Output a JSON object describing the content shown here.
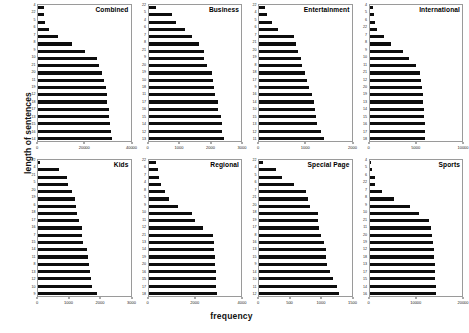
{
  "chart_data": {
    "type": "bar",
    "title": "",
    "xlabel": "frequency",
    "ylabel": "length of sentences",
    "orientation": "horizontal",
    "grid": false,
    "legend": null,
    "layout": "2 rows x 4 columns of small-multiple horizontal bar charts",
    "note": "Each panel shows frequency of sentences by sentence length, sorted ascending by frequency",
    "panels": [
      {
        "title": "Combined",
        "xlim": [
          0,
          40000
        ],
        "xticks": [
          0,
          20000,
          40000
        ],
        "xticklabels": [
          "0",
          "20000",
          "40000"
        ],
        "categories": [
          "4",
          "22",
          "5",
          "6",
          "7",
          "8",
          "9",
          "10",
          "21",
          "20",
          "11",
          "19",
          "12",
          "18",
          "17",
          "13",
          "15",
          "16",
          "14"
        ],
        "values": [
          2600,
          2700,
          3100,
          4600,
          8600,
          14500,
          20500,
          25500,
          26400,
          27600,
          28500,
          29200,
          29800,
          30000,
          30600,
          30900,
          31000,
          31400,
          31800
        ]
      },
      {
        "title": "Business",
        "xlim": [
          0,
          3000
        ],
        "xticks": [
          0,
          1000,
          2000,
          3000
        ],
        "xticklabels": [
          "0",
          "1000",
          "2000",
          "3000"
        ],
        "categories": [
          "22",
          "5",
          "4",
          "6",
          "7",
          "8",
          "21",
          "9",
          "20",
          "19",
          "10",
          "18",
          "11",
          "17",
          "16",
          "15",
          "14",
          "12",
          "13"
        ],
        "values": [
          230,
          760,
          900,
          1180,
          1400,
          1630,
          1790,
          1800,
          1900,
          2060,
          2100,
          2130,
          2160,
          2240,
          2260,
          2360,
          2370,
          2380,
          2440
        ]
      },
      {
        "title": "Entertainment",
        "xlim": [
          0,
          2000
        ],
        "xticks": [
          0,
          1000,
          2000
        ],
        "xticklabels": [
          "0",
          "1000",
          "2000"
        ],
        "categories": [
          "22",
          "4",
          "5",
          "6",
          "7",
          "21",
          "20",
          "19",
          "8",
          "18",
          "17",
          "9",
          "16",
          "14",
          "10",
          "15",
          "13",
          "12",
          "11"
        ],
        "values": [
          140,
          180,
          290,
          400,
          760,
          800,
          840,
          900,
          920,
          1000,
          1040,
          1080,
          1150,
          1190,
          1200,
          1230,
          1260,
          1330,
          1400
        ]
      },
      {
        "title": "International",
        "xlim": [
          0,
          10000
        ],
        "xticks": [
          0,
          5000,
          10000
        ],
        "xticklabels": [
          "0",
          "5000",
          "10000"
        ],
        "categories": [
          "4",
          "5",
          "6",
          "22",
          "7",
          "8",
          "9",
          "10",
          "11",
          "21",
          "12",
          "20",
          "19",
          "13",
          "14",
          "15",
          "16",
          "17",
          "18"
        ],
        "values": [
          400,
          450,
          560,
          800,
          1600,
          2350,
          3600,
          4300,
          5000,
          5500,
          5600,
          5650,
          5750,
          5800,
          5850,
          5900,
          5950,
          6000,
          6050
        ]
      },
      {
        "title": "Kids",
        "xlim": [
          0,
          3000
        ],
        "xticks": [
          0,
          1000,
          2000,
          3000
        ],
        "xticklabels": [
          "0",
          "1000",
          "2000",
          "3000"
        ],
        "categories": [
          "22",
          "4",
          "21",
          "5",
          "20",
          "19",
          "6",
          "18",
          "17",
          "16",
          "7",
          "15",
          "14",
          "11",
          "8",
          "13",
          "12",
          "10",
          "9"
        ],
        "values": [
          80,
          680,
          950,
          970,
          1090,
          1200,
          1220,
          1270,
          1330,
          1420,
          1440,
          1460,
          1580,
          1620,
          1650,
          1700,
          1720,
          1740,
          1900
        ]
      },
      {
        "title": "Regional",
        "xlim": [
          0,
          4000
        ],
        "xticks": [
          0,
          2000,
          4000
        ],
        "xticklabels": [
          "0",
          "2000",
          "4000"
        ],
        "categories": [
          "22",
          "6",
          "7",
          "4",
          "8",
          "5",
          "9",
          "10",
          "11",
          "12",
          "21",
          "13",
          "14",
          "19",
          "20",
          "16",
          "15",
          "17",
          "18"
        ],
        "values": [
          340,
          430,
          440,
          520,
          720,
          870,
          1260,
          1900,
          2000,
          2350,
          2800,
          2820,
          2840,
          2870,
          2880,
          2900,
          2920,
          2930,
          2960
        ]
      },
      {
        "title": "Special Page",
        "xlim": [
          0,
          1500
        ],
        "xticks": [
          0,
          500,
          1000,
          1500
        ],
        "xticklabels": [
          "0",
          "500",
          "1000",
          "1500"
        ],
        "categories": [
          "22",
          "4",
          "5",
          "6",
          "7",
          "21",
          "20",
          "18",
          "19",
          "17",
          "8",
          "16",
          "13",
          "15",
          "9",
          "14",
          "10",
          "11",
          "12"
        ],
        "values": [
          60,
          270,
          380,
          570,
          760,
          790,
          830,
          950,
          960,
          980,
          1010,
          1050,
          1080,
          1090,
          1100,
          1150,
          1200,
          1270,
          1300
        ]
      },
      {
        "title": "Sports",
        "xlim": [
          0,
          20000
        ],
        "xticks": [
          0,
          10000,
          20000
        ],
        "xticklabels": [
          "0",
          "10000",
          "20000"
        ],
        "categories": [
          "4",
          "5",
          "6",
          "22",
          "7",
          "8",
          "9",
          "10",
          "21",
          "11",
          "20",
          "19",
          "12",
          "18",
          "13",
          "17",
          "15",
          "14",
          "16"
        ],
        "values": [
          400,
          480,
          1100,
          1150,
          2600,
          5200,
          8700,
          10800,
          12900,
          13400,
          13600,
          13800,
          13900,
          14000,
          14100,
          14200,
          14250,
          14300,
          14400
        ]
      }
    ]
  }
}
